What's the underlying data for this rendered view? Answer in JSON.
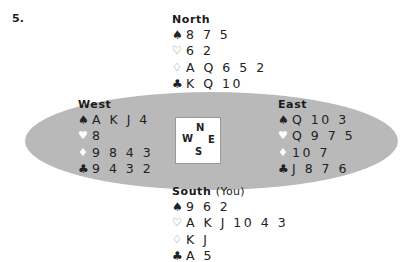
{
  "problem": {
    "number": "5."
  },
  "compass": {
    "n": "N",
    "w": "W",
    "e": "E",
    "s": "S"
  },
  "icons": {
    "spade": "♠",
    "heart_outline": "♡",
    "diamond_outline": "♢",
    "heart_filled": "♥",
    "diamond_filled": "♦",
    "club": "♣"
  },
  "hands": {
    "north": {
      "title": "North",
      "spades": "8 7 5",
      "hearts": "6 2",
      "diamonds": "A Q 6 5 2",
      "clubs": "K Q 10"
    },
    "west": {
      "title": "West",
      "spades": "A K J 4",
      "hearts": "8",
      "diamonds": "9 8 4 3",
      "clubs": "9 4 3 2"
    },
    "east": {
      "title": "East",
      "spades": "Q 10 3",
      "hearts": "Q 9 7 5",
      "diamonds": "10 7",
      "clubs": "J 8 7 6"
    },
    "south": {
      "title": "South",
      "subtitle": "(You)",
      "spades": "9 6 2",
      "hearts": "A K J 10 4 3",
      "diamonds": "K J",
      "clubs": "A 5"
    }
  },
  "colors": {
    "table": "#b9b9b9",
    "text": "#1a1a1a"
  }
}
